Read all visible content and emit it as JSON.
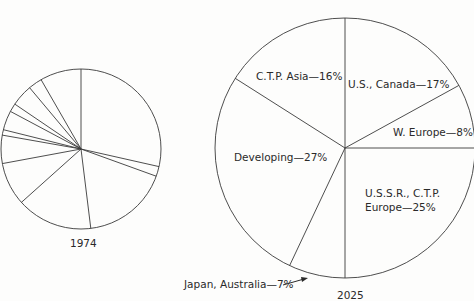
{
  "chart_data": [
    {
      "type": "pie",
      "title": "1974",
      "start_angle_deg": 0,
      "direction": "clockwise",
      "labels": [],
      "values": [
        28.5,
        2.0,
        17.5,
        15.3,
        8.7,
        5.7,
        1.1,
        3.9,
        1.7,
        4.4,
        2.8,
        8.3
      ],
      "note": "Unlabeled slices; values estimated from slice angles"
    },
    {
      "type": "pie",
      "title": "2025",
      "start_angle_deg": 0,
      "direction": "clockwise",
      "labels": [
        "U.S., Canada",
        "W. Europe",
        "U.S.S.R., C.T.P. Europe",
        "Japan, Australia",
        "Developing",
        "C.T.P. Asia"
      ],
      "values": [
        17,
        8,
        25,
        7,
        27,
        16
      ],
      "unit": "%"
    }
  ],
  "pie1974": {
    "caption": "1974",
    "center": [
      81,
      149
    ],
    "radius": 80
  },
  "pie2025": {
    "caption": "2025",
    "center": [
      345,
      148
    ],
    "radius": 130,
    "labels": {
      "ctp_asia": "C.T.P. Asia—16%",
      "us_canada": "U.S., Canada—17%",
      "w_europe": "W. Europe—8%",
      "developing": "Developing—27%",
      "ussr_line1": "U.S.S.R., C.T.P.",
      "ussr_line2": "Europe—25%",
      "japan": "Japan, Australia—7%"
    }
  }
}
